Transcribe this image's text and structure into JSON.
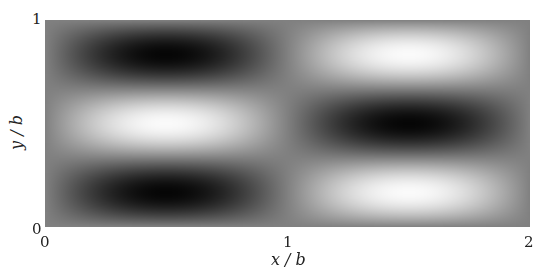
{
  "chart_data": {
    "type": "heatmap",
    "title": "",
    "xlabel": "x / b",
    "ylabel": "y / b",
    "xlim": [
      0,
      2
    ],
    "ylim": [
      0,
      1
    ],
    "xticks": [
      "0",
      "1",
      "2"
    ],
    "yticks": [
      "0",
      "1"
    ],
    "colormap": "gray",
    "grid": false,
    "field_description": "f(x,y) = -sin(pi x) * sin(3 pi y); bright at (0.5,0.5),(1.5,0.17),(1.5,0.83); dark at (0.5,0.17),(0.5,0.83),(1.5,0.5)",
    "extrema": [
      {
        "x": 0.5,
        "y": 0.83,
        "value": "min"
      },
      {
        "x": 0.5,
        "y": 0.5,
        "value": "max"
      },
      {
        "x": 0.5,
        "y": 0.17,
        "value": "min"
      },
      {
        "x": 1.5,
        "y": 0.83,
        "value": "max"
      },
      {
        "x": 1.5,
        "y": 0.5,
        "value": "min"
      },
      {
        "x": 1.5,
        "y": 0.17,
        "value": "max"
      }
    ]
  }
}
